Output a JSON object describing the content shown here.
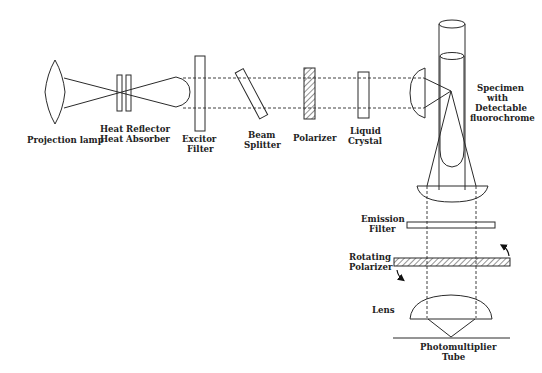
{
  "diagram": {
    "type": "optical-schematic",
    "labels": {
      "projection_lamp": "Projection lamp",
      "heat_reflector": "Heat Reflector",
      "heat_absorber": "Heat Absorber",
      "excitor_1": "Excitor",
      "excitor_2": "Filter",
      "beam_1": "Beam",
      "beam_2": "Splitter",
      "polarizer": "Polarizer",
      "liquid_1": "Liquid",
      "liquid_2": "Crystal",
      "specimen_1": "Specimen",
      "specimen_2": "with",
      "specimen_3": "Detectable",
      "specimen_4": "fluorochrome",
      "emission_1": "Emission",
      "emission_2": "Filter",
      "rotating_1": "Rotating",
      "rotating_2": "Polarizer",
      "lens": "Lens",
      "pmt_1": "Photomultiplier",
      "pmt_2": "Tube"
    },
    "components": [
      "Projection lamp",
      "Heat Reflector",
      "Heat Absorber",
      "Condenser lens",
      "Excitor Filter",
      "Beam Splitter",
      "Polarizer",
      "Liquid Crystal",
      "Focusing lens",
      "Specimen with Detectable fluorochrome",
      "Collecting lens",
      "Emission Filter",
      "Rotating Polarizer",
      "Lens",
      "Photomultiplier Tube"
    ],
    "colors": {
      "line": "#2a2a2a",
      "background": "#ffffff",
      "text": "#222222"
    }
  }
}
